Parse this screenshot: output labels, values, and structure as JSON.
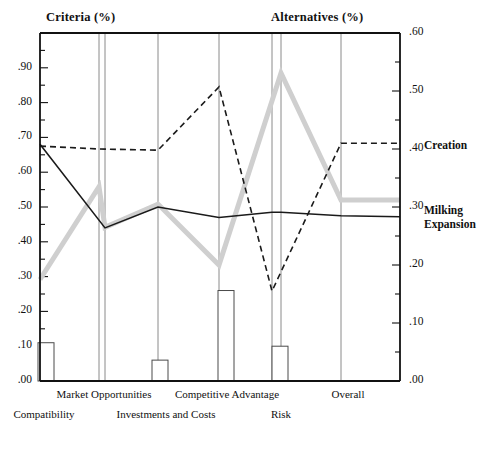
{
  "header": {
    "left_title": "Criteria (%)",
    "right_title": "Alternatives (%)"
  },
  "legend": {
    "creation": "Creation",
    "milking_line1": "Milking",
    "milking_line2": "Expansion"
  },
  "axes": {
    "left_ticks": [
      ".00",
      ".10",
      ".20",
      ".30",
      ".40",
      ".50",
      ".60",
      ".70",
      ".80",
      ".90"
    ],
    "right_ticks": [
      ".00",
      ".10",
      ".20",
      ".30",
      ".40",
      ".50",
      ".60"
    ],
    "left_range": [
      0,
      1.0
    ],
    "right_range": [
      0,
      0.6
    ]
  },
  "categories": {
    "row_top": [
      "Market Opportunities",
      "Competitive Advantage",
      "Overall"
    ],
    "row_bottom": [
      "Compatibility",
      "Investments and Costs",
      "Risk"
    ]
  },
  "chart_data": {
    "type": "line",
    "subtitle": "",
    "xlabel": "",
    "ylabel": "Criteria (%)",
    "y2label": "Alternatives (%)",
    "ylim": [
      0,
      1.0
    ],
    "y2lim": [
      0,
      0.6
    ],
    "grid": true,
    "legend_position": "right",
    "categories": [
      "Compatibility",
      "Market Opportunities",
      "Investments and Costs",
      "Competitive Advantage",
      "Risk",
      "Overall"
    ],
    "x_positions": [
      40,
      99,
      158,
      219,
      281,
      341
    ],
    "series": [
      {
        "name": "Criteria weight",
        "style": "solid-black",
        "axis": "left",
        "color": "#1a1a1a",
        "x": [
          40,
          105,
          158,
          219,
          272,
          281,
          341,
          400
        ],
        "values": [
          0.68,
          0.44,
          0.5,
          0.47,
          0.485,
          0.485,
          0.475,
          0.472
        ]
      },
      {
        "name": "Creation",
        "style": "dashed-black",
        "axis": "right",
        "color": "#1a1a1a",
        "x": [
          40,
          99,
          158,
          219,
          272,
          341,
          400
        ],
        "values": [
          0.405,
          0.4,
          0.398,
          0.507,
          0.155,
          0.41,
          0.41
        ]
      },
      {
        "name": "Milking Expansion",
        "style": "thick-gray",
        "axis": "right",
        "color": "#cfcfcf",
        "x": [
          40,
          99,
          105,
          158,
          219,
          281,
          341,
          400
        ],
        "values": [
          0.175,
          0.335,
          0.265,
          0.305,
          0.2,
          0.531,
          0.312,
          0.312
        ]
      }
    ],
    "bars": {
      "name": "Criteria contribution",
      "axis": "left",
      "color": "#ffffff",
      "edge": "#4a4a4a",
      "categories": [
        "Compatibility",
        "Investments and Costs",
        "Competitive Advantage",
        "Risk"
      ],
      "x_centers": [
        46,
        160,
        226,
        280
      ],
      "values": [
        0.11,
        0.06,
        0.26,
        0.1
      ]
    }
  }
}
